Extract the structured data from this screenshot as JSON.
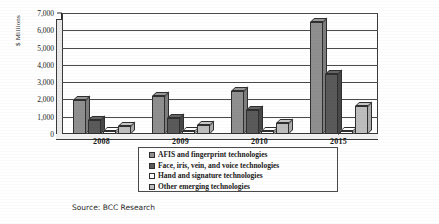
{
  "chart_data": {
    "type": "bar",
    "title": "",
    "xlabel": "",
    "ylabel": "$ Millions",
    "categories": [
      "2008",
      "2009",
      "2010",
      "2015"
    ],
    "ylim": [
      0,
      7000
    ],
    "ytick_labels": [
      "0",
      "1,000",
      "2,000",
      "3,000",
      "4,000",
      "5,000",
      "6,000",
      "7,000"
    ],
    "ytick_values": [
      0,
      1000,
      2000,
      3000,
      4000,
      5000,
      6000,
      7000
    ],
    "grid": true,
    "legend_position": "bottom",
    "series": [
      {
        "name": "AFIS and fingerprint technologies",
        "color": "#8f8f8f",
        "values": [
          1950,
          2200,
          2500,
          6500
        ]
      },
      {
        "name": "Face, iris, vein, and voice technologies",
        "color": "#5a5a5a",
        "values": [
          800,
          900,
          1400,
          3500
        ]
      },
      {
        "name": "Hand and signature technologies",
        "color": "#ffffff",
        "values": [
          150,
          160,
          180,
          200
        ]
      },
      {
        "name": "Other emerging technologies",
        "color": "#bdbdbd",
        "values": [
          450,
          520,
          620,
          1600
        ]
      }
    ]
  },
  "source": {
    "text": "Source: BCC Research"
  }
}
